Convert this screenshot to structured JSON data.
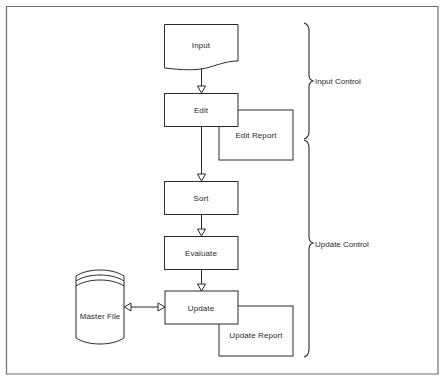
{
  "diagram": {
    "type": "flowchart",
    "nodes": {
      "input": {
        "label": "Input",
        "shape": "document"
      },
      "edit": {
        "label": "Edit",
        "shape": "process"
      },
      "edit_report": {
        "label": "Edit Report",
        "shape": "report-box"
      },
      "sort": {
        "label": "Sort",
        "shape": "process"
      },
      "evaluate": {
        "label": "Evaluate",
        "shape": "process"
      },
      "update": {
        "label": "Update",
        "shape": "process"
      },
      "update_report": {
        "label": "Update Report",
        "shape": "report-box"
      },
      "master_file": {
        "label": "Master File",
        "shape": "disk-storage"
      }
    },
    "edges": [
      {
        "from": "Input",
        "to": "Edit"
      },
      {
        "from": "Edit",
        "to": "Edit Report"
      },
      {
        "from": "Edit",
        "to": "Sort"
      },
      {
        "from": "Sort",
        "to": "Evaluate"
      },
      {
        "from": "Evaluate",
        "to": "Update"
      },
      {
        "from": "Update",
        "to": "Master File",
        "bidirectional": true
      },
      {
        "from": "Update",
        "to": "Update Report"
      }
    ],
    "groups": {
      "input_control": {
        "label": "Input Control"
      },
      "update_control": {
        "label": "Update Control"
      }
    },
    "colors": {
      "line": "#2a2a2a",
      "frame": "#6e6e6e",
      "background": "#ffffff"
    }
  }
}
